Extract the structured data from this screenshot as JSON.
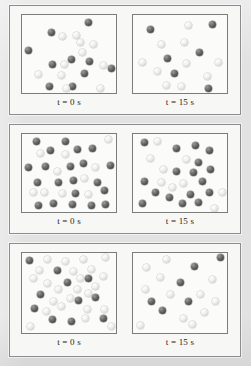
{
  "figure": {
    "type": "reaction-progress-particle-diagram",
    "page_background": "#e2e2e2",
    "panel_background": "#f7f7f5",
    "box_background": "#fbfbf9",
    "box_border_color": "#7c7c7c",
    "panel_border_color": "#8d8d8d",
    "sphere_colors": {
      "dark": "#4a4a4a",
      "light": "#e8e8e6"
    },
    "sphere_legend": {
      "dark_label": "reactant",
      "light_label": "product"
    }
  },
  "labels": {
    "time_var": "t",
    "equals": "=",
    "t0_value": "0",
    "t15_value": "15",
    "unit": "s",
    "t0_full": "t = 0 s",
    "t15_full": "t = 15 s"
  },
  "panels": [
    {
      "name": "panel-1",
      "index": 1,
      "boxes": [
        {
          "name": "box-t0",
          "caption": "t = 0 s",
          "counts": {
            "dark": 12,
            "light": 9,
            "total": 21
          },
          "spheres": [
            {
              "type": "dark",
              "x": 63,
              "y": 4
            },
            {
              "type": "dark",
              "x": 26,
              "y": 14
            },
            {
              "type": "light",
              "x": 37,
              "y": 18
            },
            {
              "type": "light",
              "x": 51,
              "y": 17
            },
            {
              "type": "dark",
              "x": 3,
              "y": 32
            },
            {
              "type": "light",
              "x": 68,
              "y": 26
            },
            {
              "type": "light",
              "x": 57,
              "y": 34
            },
            {
              "type": "dark",
              "x": 46,
              "y": 41
            },
            {
              "type": "dark",
              "x": 64,
              "y": 43
            },
            {
              "type": "dark",
              "x": 27,
              "y": 46
            },
            {
              "type": "light",
              "x": 39,
              "y": 46
            },
            {
              "type": "light",
              "x": 78,
              "y": 47
            },
            {
              "type": "dark",
              "x": 86,
              "y": 50
            },
            {
              "type": "light",
              "x": 13,
              "y": 56
            },
            {
              "type": "light",
              "x": 36,
              "y": 57
            },
            {
              "type": "dark",
              "x": 59,
              "y": 55
            },
            {
              "type": "dark",
              "x": 24,
              "y": 68
            },
            {
              "type": "dark",
              "x": 47,
              "y": 68
            },
            {
              "type": "light",
              "x": 41,
              "y": 70
            },
            {
              "type": "light",
              "x": 75,
              "y": 70
            },
            {
              "type": "light",
              "x": 55,
              "y": 24
            }
          ]
        },
        {
          "name": "box-t15",
          "caption": "t = 15 s",
          "counts": {
            "dark": 7,
            "light": 9,
            "total": 16
          },
          "spheres": [
            {
              "type": "dark",
              "x": 14,
              "y": 11
            },
            {
              "type": "light",
              "x": 52,
              "y": 7
            },
            {
              "type": "dark",
              "x": 76,
              "y": 6
            },
            {
              "type": "light",
              "x": 25,
              "y": 26
            },
            {
              "type": "light",
              "x": 48,
              "y": 24
            },
            {
              "type": "dark",
              "x": 63,
              "y": 34
            },
            {
              "type": "dark",
              "x": 31,
              "y": 40
            },
            {
              "type": "light",
              "x": 6,
              "y": 44
            },
            {
              "type": "light",
              "x": 50,
              "y": 45
            },
            {
              "type": "light",
              "x": 82,
              "y": 44
            },
            {
              "type": "light",
              "x": 21,
              "y": 53
            },
            {
              "type": "dark",
              "x": 38,
              "y": 55
            },
            {
              "type": "light",
              "x": 71,
              "y": 58
            },
            {
              "type": "light",
              "x": 30,
              "y": 67
            },
            {
              "type": "light",
              "x": 45,
              "y": 68
            },
            {
              "type": "dark",
              "x": 72,
              "y": 70
            }
          ]
        }
      ]
    },
    {
      "name": "panel-2",
      "index": 2,
      "boxes": [
        {
          "name": "box-t0",
          "caption": "t = 0 s",
          "counts": {
            "dark": 22,
            "light": 9,
            "total": 31
          },
          "spheres": [
            {
              "type": "dark",
              "x": 11,
              "y": 4
            },
            {
              "type": "dark",
              "x": 40,
              "y": 4
            },
            {
              "type": "light",
              "x": 83,
              "y": 2
            },
            {
              "type": "dark",
              "x": 25,
              "y": 13
            },
            {
              "type": "light",
              "x": 15,
              "y": 16
            },
            {
              "type": "dark",
              "x": 52,
              "y": 12
            },
            {
              "type": "light",
              "x": 40,
              "y": 17
            },
            {
              "type": "dark",
              "x": 67,
              "y": 11
            },
            {
              "type": "dark",
              "x": 3,
              "y": 30
            },
            {
              "type": "dark",
              "x": 20,
              "y": 29
            },
            {
              "type": "dark",
              "x": 45,
              "y": 29
            },
            {
              "type": "light",
              "x": 32,
              "y": 34
            },
            {
              "type": "dark",
              "x": 58,
              "y": 26
            },
            {
              "type": "light",
              "x": 70,
              "y": 30
            },
            {
              "type": "dark",
              "x": 85,
              "y": 28
            },
            {
              "type": "dark",
              "x": 12,
              "y": 45
            },
            {
              "type": "dark",
              "x": 33,
              "y": 45
            },
            {
              "type": "dark",
              "x": 48,
              "y": 43
            },
            {
              "type": "light",
              "x": 59,
              "y": 41
            },
            {
              "type": "dark",
              "x": 72,
              "y": 45
            },
            {
              "type": "light",
              "x": 8,
              "y": 55
            },
            {
              "type": "light",
              "x": 19,
              "y": 55
            },
            {
              "type": "light",
              "x": 37,
              "y": 56
            },
            {
              "type": "dark",
              "x": 50,
              "y": 56
            },
            {
              "type": "light",
              "x": 63,
              "y": 57
            },
            {
              "type": "dark",
              "x": 79,
              "y": 53
            },
            {
              "type": "dark",
              "x": 13,
              "y": 68
            },
            {
              "type": "dark",
              "x": 28,
              "y": 66
            },
            {
              "type": "dark",
              "x": 47,
              "y": 67
            },
            {
              "type": "dark",
              "x": 66,
              "y": 68
            },
            {
              "type": "dark",
              "x": 80,
              "y": 67
            }
          ]
        },
        {
          "name": "box-t15",
          "caption": "t = 15 s",
          "counts": {
            "dark": 16,
            "light": 10,
            "total": 26
          },
          "spheres": [
            {
              "type": "dark",
              "x": 8,
              "y": 5
            },
            {
              "type": "light",
              "x": 21,
              "y": 4
            },
            {
              "type": "dark",
              "x": 40,
              "y": 11
            },
            {
              "type": "dark",
              "x": 59,
              "y": 8
            },
            {
              "type": "dark",
              "x": 73,
              "y": 13
            },
            {
              "type": "light",
              "x": 14,
              "y": 21
            },
            {
              "type": "light",
              "x": 50,
              "y": 22
            },
            {
              "type": "dark",
              "x": 62,
              "y": 25
            },
            {
              "type": "light",
              "x": 27,
              "y": 32
            },
            {
              "type": "dark",
              "x": 40,
              "y": 34
            },
            {
              "type": "dark",
              "x": 57,
              "y": 35
            },
            {
              "type": "dark",
              "x": 74,
              "y": 32
            },
            {
              "type": "dark",
              "x": 8,
              "y": 44
            },
            {
              "type": "light",
              "x": 25,
              "y": 45
            },
            {
              "type": "light",
              "x": 47,
              "y": 46
            },
            {
              "type": "light",
              "x": 36,
              "y": 50
            },
            {
              "type": "dark",
              "x": 66,
              "y": 44
            },
            {
              "type": "dark",
              "x": 19,
              "y": 55
            },
            {
              "type": "dark",
              "x": 33,
              "y": 60
            },
            {
              "type": "dark",
              "x": 54,
              "y": 57
            },
            {
              "type": "dark",
              "x": 73,
              "y": 55
            },
            {
              "type": "light",
              "x": 86,
              "y": 55
            },
            {
              "type": "dark",
              "x": 6,
              "y": 66
            },
            {
              "type": "dark",
              "x": 46,
              "y": 66
            },
            {
              "type": "dark",
              "x": 62,
              "y": 65
            },
            {
              "type": "light",
              "x": 78,
              "y": 71
            }
          ]
        }
      ]
    },
    {
      "name": "panel-3",
      "index": 3,
      "boxes": [
        {
          "name": "box-t0",
          "caption": "t = 0 s",
          "counts": {
            "dark": 11,
            "light": 22,
            "total": 33
          },
          "spheres": [
            {
              "type": "dark",
              "x": 4,
              "y": 4
            },
            {
              "type": "light",
              "x": 22,
              "y": 3
            },
            {
              "type": "light",
              "x": 40,
              "y": 5
            },
            {
              "type": "light",
              "x": 58,
              "y": 3
            },
            {
              "type": "light",
              "x": 80,
              "y": 1
            },
            {
              "type": "light",
              "x": 14,
              "y": 14
            },
            {
              "type": "dark",
              "x": 32,
              "y": 14
            },
            {
              "type": "light",
              "x": 48,
              "y": 15
            },
            {
              "type": "light",
              "x": 66,
              "y": 13
            },
            {
              "type": "light",
              "x": 8,
              "y": 22
            },
            {
              "type": "light",
              "x": 55,
              "y": 22
            },
            {
              "type": "dark",
              "x": 63,
              "y": 22
            },
            {
              "type": "light",
              "x": 78,
              "y": 20
            },
            {
              "type": "light",
              "x": 22,
              "y": 27
            },
            {
              "type": "dark",
              "x": 42,
              "y": 26
            },
            {
              "type": "light",
              "x": 70,
              "y": 30
            },
            {
              "type": "light",
              "x": 33,
              "y": 33
            },
            {
              "type": "light",
              "x": 52,
              "y": 33
            },
            {
              "type": "dark",
              "x": 15,
              "y": 38
            },
            {
              "type": "light",
              "x": 63,
              "y": 37
            },
            {
              "type": "light",
              "x": 45,
              "y": 42
            },
            {
              "type": "dark",
              "x": 53,
              "y": 44
            },
            {
              "type": "dark",
              "x": 70,
              "y": 41
            },
            {
              "type": "light",
              "x": 28,
              "y": 45
            },
            {
              "type": "light",
              "x": 36,
              "y": 50
            },
            {
              "type": "dark",
              "x": 9,
              "y": 52
            },
            {
              "type": "light",
              "x": 21,
              "y": 55
            },
            {
              "type": "light",
              "x": 62,
              "y": 53
            },
            {
              "type": "light",
              "x": 79,
              "y": 53
            },
            {
              "type": "dark",
              "x": 27,
              "y": 63
            },
            {
              "type": "dark",
              "x": 46,
              "y": 65
            },
            {
              "type": "light",
              "x": 60,
              "y": 62
            },
            {
              "type": "dark",
              "x": 78,
              "y": 62
            },
            {
              "type": "light",
              "x": 5,
              "y": 70
            },
            {
              "type": "light",
              "x": 86,
              "y": 70
            }
          ]
        },
        {
          "name": "box-t15",
          "caption": "t = 15 s",
          "counts": {
            "dark": 6,
            "light": 12,
            "total": 18
          },
          "spheres": [
            {
              "type": "light",
              "x": 30,
              "y": 3
            },
            {
              "type": "dark",
              "x": 84,
              "y": 1
            },
            {
              "type": "light",
              "x": 10,
              "y": 11
            },
            {
              "type": "dark",
              "x": 58,
              "y": 10
            },
            {
              "type": "light",
              "x": 24,
              "y": 21
            },
            {
              "type": "light",
              "x": 76,
              "y": 23
            },
            {
              "type": "dark",
              "x": 44,
              "y": 26
            },
            {
              "type": "light",
              "x": 9,
              "y": 33
            },
            {
              "type": "light",
              "x": 34,
              "y": 38
            },
            {
              "type": "light",
              "x": 64,
              "y": 38
            },
            {
              "type": "dark",
              "x": 15,
              "y": 45
            },
            {
              "type": "dark",
              "x": 52,
              "y": 45
            },
            {
              "type": "light",
              "x": 79,
              "y": 45
            },
            {
              "type": "dark",
              "x": 26,
              "y": 54
            },
            {
              "type": "light",
              "x": 68,
              "y": 56
            },
            {
              "type": "light",
              "x": 47,
              "y": 62
            },
            {
              "type": "light",
              "x": 4,
              "y": 69
            },
            {
              "type": "light",
              "x": 56,
              "y": 68
            }
          ]
        }
      ]
    }
  ]
}
